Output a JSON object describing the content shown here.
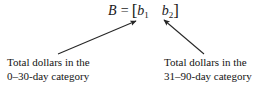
{
  "figure": {
    "name": "matrix-b-annotated",
    "background_color": "#ffffff",
    "text_color": "#1a1a1a",
    "equation": {
      "variable": "B",
      "relation": "=",
      "bracket_open": "[",
      "bracket_close": "]",
      "entries": [
        {
          "base": "b",
          "subscript": "1"
        },
        {
          "base": "b",
          "subscript": "2"
        }
      ]
    },
    "annotations": [
      {
        "id": "left",
        "target_entry": "b1",
        "lines": [
          "Total dollars in the",
          "0–30-day category"
        ]
      },
      {
        "id": "right",
        "target_entry": "b2",
        "lines": [
          "Total dollars in the",
          "31–90-day category"
        ]
      }
    ],
    "arrows": {
      "stroke_color": "#262626",
      "left": {
        "x1": 58,
        "y1": 54,
        "x2": 136,
        "y2": 21
      },
      "right": {
        "x1": 204,
        "y1": 54,
        "x2": 164,
        "y2": 20
      }
    }
  }
}
